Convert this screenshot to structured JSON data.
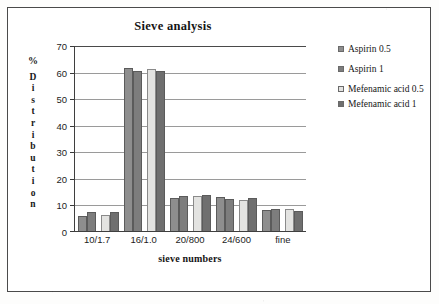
{
  "chart_data": {
    "type": "bar",
    "title": "Sieve analysis",
    "xlabel": "sieve numbers",
    "ylabel": "% Distribution",
    "ylabel_pct": "%",
    "ylabel_word": "Distribution",
    "categories": [
      "10/1.7",
      "16/1.0",
      "20/800",
      "24/600",
      "fine"
    ],
    "ylim": [
      0,
      70
    ],
    "yticks": [
      70,
      60,
      50,
      40,
      30,
      20,
      10,
      0
    ],
    "grid": true,
    "legend_position": "right",
    "series": [
      {
        "name": "Aspirin 0.5",
        "color": "#8e8e8e",
        "values": [
          5.5,
          61.5,
          12.3,
          12.9,
          7.8
        ]
      },
      {
        "name": "Aspirin 1",
        "color": "#7d7d7d",
        "values": [
          7.0,
          60.2,
          13.0,
          11.9,
          8.3
        ]
      },
      {
        "name": "Mefenamic acid 0.5",
        "color": "#e3e3e1",
        "values": [
          6.0,
          61.0,
          13.3,
          11.7,
          8.1
        ]
      },
      {
        "name": "Mefenamic acid 1",
        "color": "#6f6f6f",
        "values": [
          7.2,
          60.3,
          13.7,
          12.3,
          7.4
        ]
      }
    ]
  },
  "legend": {
    "items": [
      {
        "label": "Aspirin 0.5"
      },
      {
        "label": "Aspirin 1"
      },
      {
        "label": "Mefenamic acid 0.5"
      },
      {
        "label": "Mefenamic acid 1"
      }
    ]
  }
}
